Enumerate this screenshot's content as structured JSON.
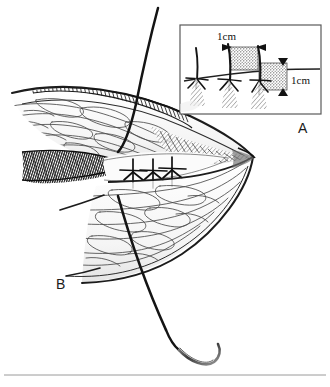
{
  "figure": {
    "type": "surgical-line-illustration",
    "background_color": "#ffffff",
    "ink_color": "#1a1a1a",
    "width": 330,
    "height": 387,
    "footer_rule": true
  },
  "panels": [
    {
      "id": "A",
      "label": "A",
      "kind": "inset-detail",
      "label_position": {
        "x": 298,
        "y": 120
      },
      "frame": {
        "x": 179,
        "y": 24,
        "width": 143,
        "height": 91,
        "stroke": "#555555"
      },
      "description": "Detail of suture spacing and bite depth",
      "measurements": [
        {
          "id": "horizontal-span",
          "label": "1cm",
          "orientation": "horizontal",
          "x": 217,
          "y": 35
        },
        {
          "id": "vertical-span",
          "label": "1cm",
          "orientation": "vertical",
          "x": 290,
          "y": 88
        }
      ],
      "stipple_blocks": [
        {
          "id": "block-1",
          "x": 230,
          "y": 47,
          "width": 28,
          "height": 23,
          "fill": "#b9b9b9"
        },
        {
          "id": "block-2",
          "x": 259,
          "y": 63,
          "width": 28,
          "height": 27,
          "fill": "#b9b9b9"
        }
      ],
      "suture_knots": 3,
      "arrow_markers": 6
    },
    {
      "id": "B",
      "label": "B",
      "kind": "main-view",
      "label_position": {
        "x": 56,
        "y": 276
      },
      "description": "Everted wound edges approximated with three interrupted sutures"
    }
  ],
  "main_view": {
    "serrated_edge": {
      "name": "cut-skin-edge-hatching",
      "teeth": 46,
      "description": "Hatched comb-like cut epidermal margin along upper left"
    },
    "muscle_wedge": {
      "name": "hatched-muscle-wedge",
      "description": "Dark densely hatched triangular muscle belly at left"
    },
    "suture_knots": {
      "count": 3,
      "positions": [
        {
          "x": 133,
          "y": 173
        },
        {
          "x": 153,
          "y": 174
        },
        {
          "x": 172,
          "y": 172
        }
      ],
      "description": "Three interrupted star-shaped suture knots along the closure line"
    },
    "tissue_flap": {
      "name": "fascia-flap",
      "description": "Two overlapping tissue leaves meeting at an apex on the right"
    }
  },
  "instrument": {
    "name": "curved-surgical-needle-with-suture",
    "thread": {
      "name": "suture-thread",
      "color": "#141414",
      "description": "Long thread entering top of field, passing through tissue, exiting to the needle below"
    },
    "needle": {
      "name": "curved-needle",
      "curvature": "3/8 circle",
      "tip_position": {
        "x": 212,
        "y": 367
      }
    }
  },
  "annotations": {
    "unit_label": "1cm",
    "panel_a": "A",
    "panel_b": "B"
  }
}
